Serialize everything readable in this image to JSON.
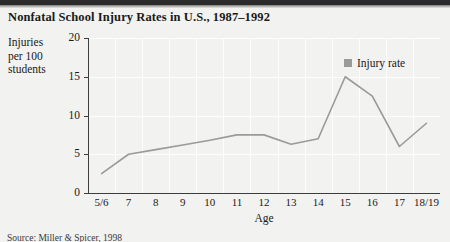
{
  "title": "Nonfatal School Injury Rates in U.S., 1987–1992",
  "y_axis_caption": [
    "Injuries",
    "per 100",
    "students"
  ],
  "source_note": "Source: Miller & Spicer, 1998",
  "legend": {
    "position": "inside-top-right",
    "entries": [
      {
        "label": "Injury rate",
        "color": "#9a9a9a",
        "marker": "square-swatch"
      }
    ]
  },
  "chart_data": {
    "type": "line",
    "title": "Nonfatal School Injury Rates in U.S., 1987–1992",
    "xlabel": "Age",
    "ylabel": "Injuries per 100 students",
    "categories": [
      "5/6",
      "7",
      "8",
      "9",
      "10",
      "11",
      "12",
      "13",
      "14",
      "15",
      "16",
      "17",
      "18/19"
    ],
    "values": [
      2.5,
      5.0,
      5.6,
      6.2,
      6.8,
      7.5,
      7.5,
      6.3,
      7.0,
      15.0,
      12.5,
      6.0,
      9.0
    ],
    "series": [
      {
        "name": "Injury rate",
        "color": "#9a9a9a",
        "values": [
          2.5,
          5.0,
          5.6,
          6.2,
          6.8,
          7.5,
          7.5,
          6.3,
          7.0,
          15.0,
          12.5,
          6.0,
          9.0
        ]
      }
    ],
    "ylim": [
      0,
      20
    ],
    "yticks": [
      0,
      5,
      10,
      15,
      20
    ],
    "ytick_labels": [
      "0",
      "5",
      "10",
      "15",
      "20"
    ],
    "grid": true,
    "grid_color": "#fdfdfd",
    "legend_position": "inside-top-right"
  }
}
